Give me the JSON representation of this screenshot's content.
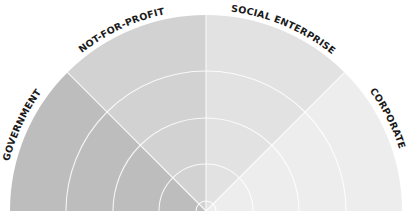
{
  "diagram": {
    "type": "semicircle-sector-diagram",
    "center": {
      "x": 206,
      "y": 211
    },
    "outer_radius": 196,
    "ring_radii": [
      10,
      47,
      93,
      140
    ],
    "background": "#ffffff",
    "sectors": [
      {
        "id": "government",
        "label": "GOVERNMENT",
        "start_angle": 135,
        "end_angle": 180,
        "color": "#bdbdbd"
      },
      {
        "id": "not-for-profit",
        "label": "NOT-FOR-PROFIT",
        "start_angle": 90,
        "end_angle": 135,
        "color": "#d2d2d2"
      },
      {
        "id": "social-enterprise",
        "label": "SOCIAL ENTERPRISE",
        "start_angle": 45,
        "end_angle": 90,
        "color": "#e2e2e2"
      },
      {
        "id": "corporate",
        "label": "CORPORATE",
        "start_angle": 0,
        "end_angle": 45,
        "color": "#ededed"
      }
    ]
  }
}
